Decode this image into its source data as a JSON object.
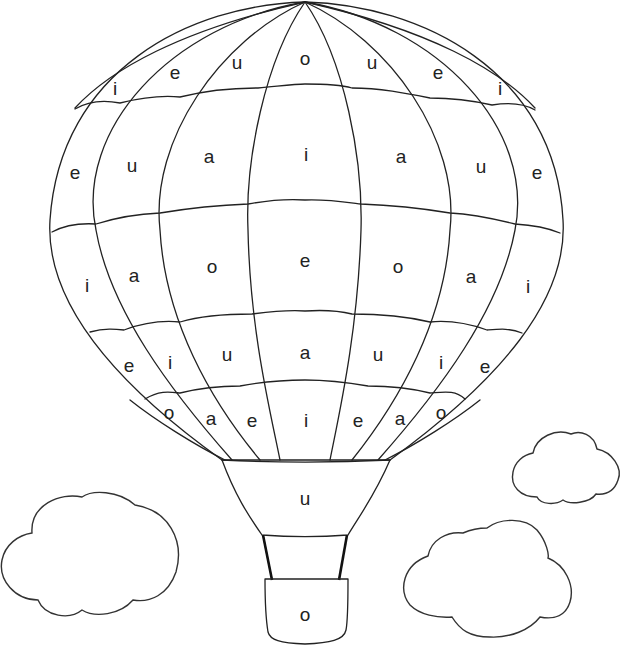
{
  "colors": {
    "line": "#222222",
    "background": "#ffffff"
  },
  "balloon": {
    "rows": [
      {
        "name": "row-1-top",
        "letters": [
          {
            "char": "i",
            "x": 115,
            "y": 88
          },
          {
            "char": "e",
            "x": 175,
            "y": 72
          },
          {
            "char": "u",
            "x": 237,
            "y": 62
          },
          {
            "char": "o",
            "x": 305,
            "y": 58
          },
          {
            "char": "u",
            "x": 372,
            "y": 62
          },
          {
            "char": "e",
            "x": 438,
            "y": 72
          },
          {
            "char": "i",
            "x": 500,
            "y": 88
          }
        ]
      },
      {
        "name": "row-2",
        "letters": [
          {
            "char": "e",
            "x": 75,
            "y": 172
          },
          {
            "char": "u",
            "x": 132,
            "y": 165
          },
          {
            "char": "a",
            "x": 209,
            "y": 156
          },
          {
            "char": "i",
            "x": 306,
            "y": 154
          },
          {
            "char": "a",
            "x": 401,
            "y": 156
          },
          {
            "char": "u",
            "x": 481,
            "y": 166
          },
          {
            "char": "e",
            "x": 537,
            "y": 172
          }
        ]
      },
      {
        "name": "row-3",
        "letters": [
          {
            "char": "i",
            "x": 87,
            "y": 285
          },
          {
            "char": "a",
            "x": 134,
            "y": 275
          },
          {
            "char": "o",
            "x": 212,
            "y": 266
          },
          {
            "char": "e",
            "x": 305,
            "y": 260
          },
          {
            "char": "o",
            "x": 398,
            "y": 266
          },
          {
            "char": "a",
            "x": 471,
            "y": 276
          },
          {
            "char": "i",
            "x": 528,
            "y": 286
          }
        ]
      },
      {
        "name": "row-4",
        "letters": [
          {
            "char": "e",
            "x": 129,
            "y": 365
          },
          {
            "char": "i",
            "x": 170,
            "y": 362
          },
          {
            "char": "u",
            "x": 227,
            "y": 354
          },
          {
            "char": "a",
            "x": 305,
            "y": 352
          },
          {
            "char": "u",
            "x": 378,
            "y": 354
          },
          {
            "char": "i",
            "x": 441,
            "y": 362
          },
          {
            "char": "e",
            "x": 485,
            "y": 366
          }
        ]
      },
      {
        "name": "row-5-bottom",
        "letters": [
          {
            "char": "o",
            "x": 169,
            "y": 412
          },
          {
            "char": "a",
            "x": 211,
            "y": 418
          },
          {
            "char": "e",
            "x": 252,
            "y": 420
          },
          {
            "char": "i",
            "x": 306,
            "y": 420
          },
          {
            "char": "e",
            "x": 358,
            "y": 420
          },
          {
            "char": "a",
            "x": 400,
            "y": 418
          },
          {
            "char": "o",
            "x": 441,
            "y": 412
          }
        ]
      }
    ]
  },
  "skirt": {
    "letter": {
      "char": "u",
      "x": 305,
      "y": 498
    }
  },
  "basket": {
    "letter": {
      "char": "o",
      "x": 305,
      "y": 614
    }
  },
  "clouds": [
    {
      "name": "cloud-left"
    },
    {
      "name": "cloud-right-small"
    },
    {
      "name": "cloud-right-large"
    }
  ]
}
